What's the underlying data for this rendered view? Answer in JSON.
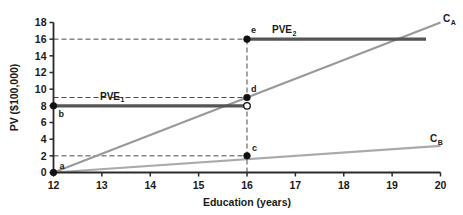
{
  "chart_data": {
    "type": "line",
    "title": "",
    "xlabel": "Education (years)",
    "ylabel": "PV ($100,000)",
    "xlim": [
      12,
      20
    ],
    "ylim": [
      0,
      18
    ],
    "xticks": [
      "12",
      "13",
      "14",
      "15",
      "16",
      "17",
      "18",
      "19",
      "20"
    ],
    "yticks": [
      "0",
      "2",
      "4",
      "6",
      "8",
      "10",
      "12",
      "14",
      "16",
      "18"
    ],
    "grid": false,
    "legend": "inline-labels",
    "series": [
      {
        "name": "C_A",
        "label": "C",
        "sublabel": "A",
        "color": "#999999",
        "style": "solid",
        "width": 2.2,
        "x": [
          12,
          20
        ],
        "values": [
          0,
          18
        ]
      },
      {
        "name": "C_B",
        "label": "C",
        "sublabel": "B",
        "color": "#aaaaaa",
        "style": "solid",
        "width": 2.2,
        "x": [
          12,
          20
        ],
        "values": [
          0,
          3.2
        ]
      },
      {
        "name": "PVE_1",
        "label": "PVE",
        "sublabel": "1",
        "color": "#555555",
        "style": "solid",
        "width": 3.2,
        "x": [
          12,
          16
        ],
        "values": [
          8,
          8
        ]
      },
      {
        "name": "PVE_2",
        "label": "PVE",
        "sublabel": "2",
        "color": "#555555",
        "style": "solid",
        "width": 3.2,
        "x": [
          16,
          19.7
        ],
        "values": [
          16,
          16
        ]
      }
    ],
    "points": [
      {
        "id": "a",
        "label": "a",
        "x": 12,
        "y": 0,
        "marker": "filled",
        "label_dx": 6,
        "label_dy": -4
      },
      {
        "id": "b",
        "label": "b",
        "x": 12,
        "y": 8,
        "marker": "filled",
        "label_dx": 5,
        "label_dy": 11
      },
      {
        "id": "c",
        "label": "c",
        "x": 16,
        "y": 2,
        "marker": "filled",
        "label_dx": 5,
        "label_dy": -5
      },
      {
        "id": "d",
        "label": "d",
        "x": 16,
        "y": 9,
        "marker": "filled",
        "label_dx": 4,
        "label_dy": -6
      },
      {
        "id": "e",
        "label": "e",
        "x": 16,
        "y": 16,
        "marker": "filled",
        "label_dx": 4,
        "label_dy": -6
      },
      {
        "id": "f",
        "label": "",
        "x": 16,
        "y": 8,
        "marker": "open",
        "label_dx": 0,
        "label_dy": 0
      }
    ],
    "guides": [
      {
        "id": "h16",
        "orient": "horizontal",
        "value": 16,
        "from": 12,
        "to": 16
      },
      {
        "id": "h9",
        "orient": "horizontal",
        "value": 9,
        "from": 12,
        "to": 16
      },
      {
        "id": "h2",
        "orient": "horizontal",
        "value": 2,
        "from": 12,
        "to": 16
      },
      {
        "id": "v16",
        "orient": "vertical",
        "value": 16,
        "from": 0,
        "to": 16
      }
    ],
    "colors": {
      "axis": "#2a2a2a",
      "dashed_guide": "#4a4a4a",
      "steep_line": "#999999",
      "shallow_line": "#aaaaaa",
      "pve_line": "#555555",
      "background": "#ffffff"
    }
  }
}
